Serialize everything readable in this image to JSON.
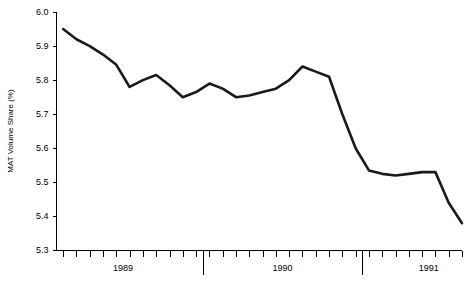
{
  "chart_data": {
    "type": "line",
    "title": "",
    "xlabel": "",
    "ylabel": "MAT Volume Share (%)",
    "ylim": [
      5.3,
      6.0
    ],
    "y_ticks": [
      5.3,
      5.4,
      5.5,
      5.6,
      5.7,
      5.8,
      5.9,
      6.0
    ],
    "y_tick_labels": [
      "5.3",
      "5.4",
      "5.5",
      "5.6",
      "5.7",
      "5.8",
      "5.9",
      "6.0"
    ],
    "x_year_labels": [
      "1989",
      "1990",
      "1991"
    ],
    "grid": false,
    "legend": false,
    "legend_position": "none",
    "x_tick_count": 31,
    "x_axis_note": "monthly ticks; long separator ticks mark year boundaries",
    "series": [
      {
        "name": "MAT Volume Share",
        "color": "#1a1a1a",
        "x": [
          0,
          1,
          2,
          3,
          4,
          5,
          6,
          7,
          8,
          9,
          10,
          11,
          12,
          13,
          14,
          15,
          16,
          17,
          18,
          19,
          20,
          21,
          22,
          23,
          24,
          25,
          26,
          27,
          28,
          29,
          30
        ],
        "values": [
          5.95,
          5.92,
          5.9,
          5.875,
          5.845,
          5.78,
          5.8,
          5.815,
          5.785,
          5.75,
          5.765,
          5.79,
          5.775,
          5.75,
          5.755,
          5.765,
          5.775,
          5.8,
          5.84,
          5.825,
          5.81,
          5.7,
          5.6,
          5.535,
          5.525,
          5.52,
          5.525,
          5.53,
          5.53,
          5.44,
          5.38
        ]
      }
    ]
  },
  "axis": {
    "y_title": "MAT Volume Share (%)"
  }
}
